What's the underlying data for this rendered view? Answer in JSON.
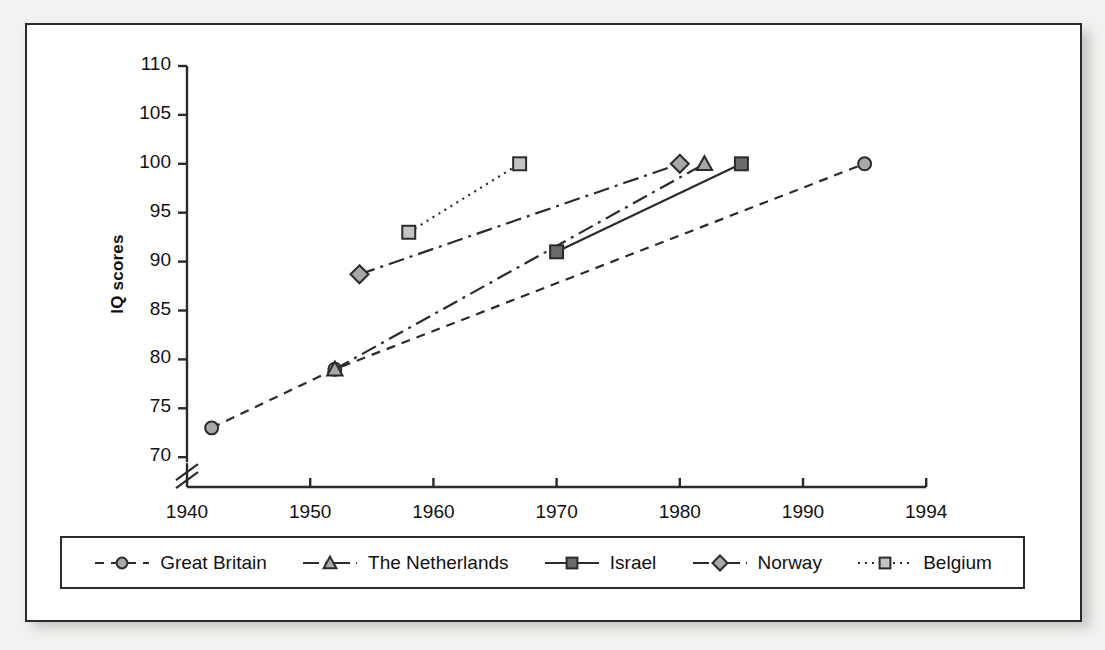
{
  "chart_data": {
    "type": "line",
    "title": "",
    "xlabel": "",
    "ylabel": "IQ scores",
    "xlim": [
      1940,
      1994
    ],
    "ylim": [
      70,
      110
    ],
    "y_axis_break": true,
    "grid": false,
    "legend_position": "bottom",
    "x_ticks": [
      "1940",
      "1950",
      "1960",
      "1970",
      "1980",
      "1990",
      "1994"
    ],
    "x_tick_values": [
      1940,
      1950,
      1960,
      1970,
      1980,
      1990,
      1994
    ],
    "y_ticks": [
      "70",
      "75",
      "80",
      "85",
      "90",
      "95",
      "100",
      "105",
      "110"
    ],
    "y_tick_values": [
      70,
      75,
      80,
      85,
      90,
      95,
      100,
      105,
      110
    ],
    "series": [
      {
        "name": "Great Britain",
        "marker": "circle",
        "line_style": "dashed",
        "fill": "#a8a8a8",
        "stroke": "#2b2b2b",
        "x": [
          1942,
          1952,
          1992
        ],
        "y": [
          73,
          79,
          100
        ]
      },
      {
        "name": "The Netherlands",
        "marker": "triangle",
        "line_style": "dashdot",
        "fill": "#a8a8a8",
        "stroke": "#2b2b2b",
        "x": [
          1952,
          1982
        ],
        "y": [
          79,
          100
        ]
      },
      {
        "name": "Israel",
        "marker": "square",
        "line_style": "solid",
        "fill": "#6b6b6b",
        "stroke": "#2b2b2b",
        "x": [
          1970,
          1985
        ],
        "y": [
          91,
          100
        ]
      },
      {
        "name": "Norway",
        "marker": "diamond",
        "line_style": "dashdot",
        "fill": "#a8a8a8",
        "stroke": "#2b2b2b",
        "x": [
          1954,
          1980
        ],
        "y": [
          88.7,
          100
        ]
      },
      {
        "name": "Belgium",
        "marker": "square",
        "line_style": "dotted",
        "fill": "#c4c4c4",
        "stroke": "#2b2b2b",
        "x": [
          1958,
          1967
        ],
        "y": [
          93,
          100
        ]
      }
    ]
  },
  "legend": {
    "entries": [
      {
        "label": "Great Britain"
      },
      {
        "label": "The Netherlands"
      },
      {
        "label": "Israel"
      },
      {
        "label": "Norway"
      },
      {
        "label": "Belgium"
      }
    ]
  },
  "colors": {
    "axis": "#2b2b2b",
    "text": "#111111",
    "page_background": "#f2f2f0",
    "figure_background": "#ffffff"
  }
}
